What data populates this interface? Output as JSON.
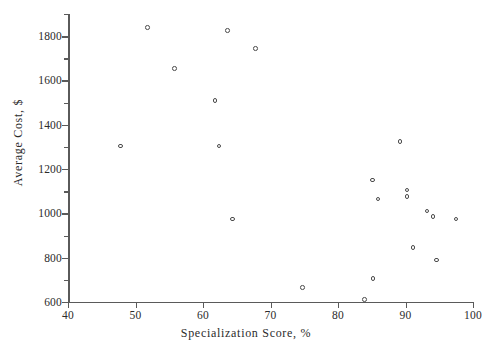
{
  "chart_data": {
    "type": "scatter",
    "title": "",
    "xlabel": "Specialization Score, %",
    "ylabel": "Average Cost, $",
    "xlim": [
      40,
      100
    ],
    "ylim": [
      600,
      1900
    ],
    "xticks": [
      40,
      50,
      60,
      70,
      80,
      90,
      100
    ],
    "yticks": [
      600,
      800,
      1000,
      1200,
      1400,
      1600,
      1800
    ],
    "y_minor_ticks": [
      700,
      900,
      1100,
      1300,
      1500,
      1700,
      1900
    ],
    "grid": false,
    "legend": null,
    "marker": "open-circle",
    "marker_color": "#4a4a4a",
    "points": [
      {
        "x": 47.8,
        "y": 1305
      },
      {
        "x": 51.8,
        "y": 1840
      },
      {
        "x": 55.8,
        "y": 1655
      },
      {
        "x": 61.8,
        "y": 1510
      },
      {
        "x": 63.6,
        "y": 1825
      },
      {
        "x": 62.4,
        "y": 1305
      },
      {
        "x": 64.4,
        "y": 975
      },
      {
        "x": 67.8,
        "y": 1745
      },
      {
        "x": 74.7,
        "y": 665
      },
      {
        "x": 83.9,
        "y": 610
      },
      {
        "x": 85.2,
        "y": 705
      },
      {
        "x": 85.1,
        "y": 1150
      },
      {
        "x": 85.9,
        "y": 1065
      },
      {
        "x": 89.2,
        "y": 1325
      },
      {
        "x": 90.2,
        "y": 1105
      },
      {
        "x": 90.2,
        "y": 1075
      },
      {
        "x": 91.1,
        "y": 845
      },
      {
        "x": 93.2,
        "y": 1010
      },
      {
        "x": 94.1,
        "y": 985
      },
      {
        "x": 94.6,
        "y": 790
      },
      {
        "x": 97.5,
        "y": 975
      }
    ]
  }
}
